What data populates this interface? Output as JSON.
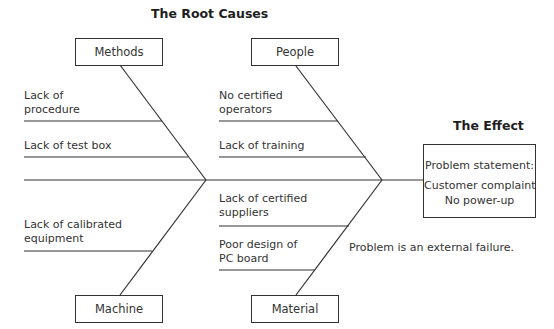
{
  "diagram": {
    "type": "fishbone",
    "title": "The Root Causes",
    "effect": {
      "heading": "The Effect",
      "statement_label": "Problem statement:",
      "lines": [
        "Customer complaint",
        "No power-up"
      ]
    },
    "note": "Problem is an external failure.",
    "categories": [
      {
        "name": "Methods",
        "causes": [
          [
            "Lack of",
            "procedure"
          ],
          [
            "Lack of test box"
          ]
        ]
      },
      {
        "name": "People",
        "causes": [
          [
            "No certified",
            "operators"
          ],
          [
            "Lack of training"
          ]
        ]
      },
      {
        "name": "Machine",
        "causes": [
          [
            "Lack of calibrated",
            "equipment"
          ]
        ]
      },
      {
        "name": "Material",
        "causes": [
          [
            "Lack of certified",
            "suppliers"
          ],
          [
            "Poor design of",
            "PC board"
          ]
        ]
      }
    ],
    "line_color": "#333333"
  }
}
